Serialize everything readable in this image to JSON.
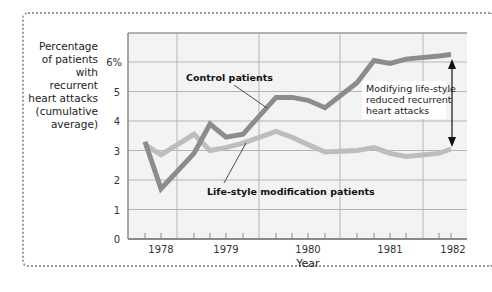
{
  "chart_data": {
    "type": "line",
    "title": "",
    "ylabel": "Percentage of patients with recurrent heart attacks (cumulative average)",
    "ylabel_lines": [
      "Percentage",
      "of patients",
      "with recurrent",
      "heart attacks",
      "(cumulative",
      "average)"
    ],
    "xlabel": "Year",
    "ylim": [
      0,
      6.5
    ],
    "yticks": [
      "0",
      "1",
      "2",
      "3",
      "4",
      "5",
      "6%"
    ],
    "xticks": [
      "1978",
      "1979",
      "1980",
      "1981",
      "1982"
    ],
    "grid": true,
    "x": [
      1978.0,
      1978.2,
      1978.6,
      1978.8,
      1979.0,
      1979.2,
      1979.6,
      1979.8,
      1980.0,
      1980.2,
      1980.6,
      1980.8,
      1981.0,
      1981.2,
      1981.6,
      1981.8
    ],
    "series": [
      {
        "name": "Control patients",
        "color": "#8c8c8c",
        "values": [
          3.3,
          1.7,
          2.9,
          3.9,
          3.45,
          3.55,
          4.8,
          4.8,
          4.7,
          4.45,
          5.3,
          6.05,
          5.95,
          6.1,
          6.2,
          6.25
        ]
      },
      {
        "name": "Life-style modification patients",
        "color": "#bdbdbd",
        "values": [
          3.2,
          2.85,
          3.55,
          3.0,
          3.1,
          3.25,
          3.65,
          3.45,
          3.2,
          2.95,
          3.0,
          3.1,
          2.9,
          2.8,
          2.9,
          3.05
        ]
      }
    ],
    "annotations": [
      {
        "text": "Control patients",
        "target": "Control patients"
      },
      {
        "text": "Life-style modification patients",
        "target": "Life-style modification patients"
      },
      {
        "text": "Modifying life-style reduced recurrent heart attacks",
        "lines": [
          "Modifying life-style",
          "reduced recurrent",
          "heart attacks"
        ],
        "type": "double-arrow",
        "between": [
          "Control patients",
          "Life-style modification patients"
        ],
        "at_x": "1982"
      }
    ],
    "legend": "none (inline labels)"
  }
}
